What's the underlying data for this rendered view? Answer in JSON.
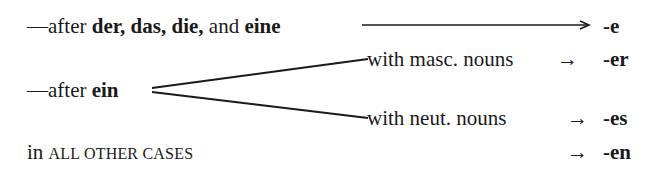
{
  "rules": [
    {
      "prefix": "—after ",
      "bold_words": "der, das, die,",
      "middle": " and ",
      "bold_last": "eine",
      "suffix": "-e"
    },
    {
      "prefix": "—after ",
      "bold_words": "ein",
      "branches": [
        {
          "label": "with masc. nouns",
          "arrow": "→",
          "suffix": "-er"
        },
        {
          "label": "with neut. nouns",
          "arrow": "→",
          "suffix": "-es"
        }
      ]
    },
    {
      "prefix": "in ",
      "small_caps": "ALL OTHER CASES",
      "arrow": "→",
      "suffix": "-en"
    }
  ],
  "colors": {
    "text": "#1a1a1a",
    "background": "#ffffff"
  }
}
